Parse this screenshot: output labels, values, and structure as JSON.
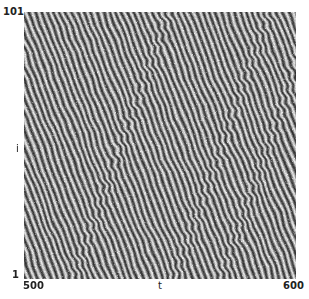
{
  "chart_data": {
    "type": "heatmap",
    "title": "",
    "xlabel": "t",
    "ylabel": "i",
    "xlim": [
      500,
      600
    ],
    "ylim": [
      1,
      101
    ],
    "x_ticks": [
      "500",
      "600"
    ],
    "y_ticks": [
      "1",
      "101"
    ],
    "colormap": "grayscale",
    "grid": false,
    "legend": null,
    "pattern": {
      "stripe_period_px": 6.2,
      "stripe_slope": 2.6,
      "defect_bands": [
        0.18,
        0.55,
        0.72
      ]
    },
    "colors": {
      "dark": "#3a3a3a",
      "mid": "#7a7a7a",
      "light": "#e8e8e8"
    }
  },
  "axes": {
    "y_top": "101",
    "y_bottom": "1",
    "y_label": "i",
    "x_left": "500",
    "x_right": "600",
    "x_label": "t"
  }
}
